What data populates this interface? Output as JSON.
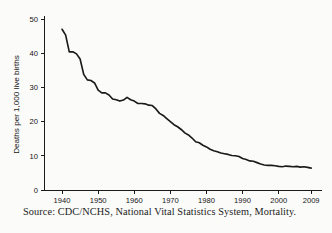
{
  "figure": {
    "source_note": "Source: CDC/NCHS, National Vital Statistics System, Mortality.",
    "background_color": "#fbfbfa",
    "line_color": "#1a1a1a",
    "axis_color": "#1b1b1b"
  },
  "chart_data": {
    "type": "line",
    "title": "",
    "subtitle": "",
    "xlabel": "",
    "ylabel": "Deaths per 1,000 live births",
    "xlim": [
      1935,
      2012
    ],
    "ylim": [
      0,
      50
    ],
    "grid": false,
    "legend": null,
    "legend_position": "none",
    "xticks": [
      1940,
      1950,
      1960,
      1970,
      1980,
      1990,
      2000,
      2009
    ],
    "xticklabels": [
      "1940",
      "1950",
      "1960",
      "1970",
      "1980",
      "1990",
      "2000",
      "2009"
    ],
    "yticks": [
      0,
      10,
      20,
      30,
      40,
      50
    ],
    "yticklabels": [
      "0",
      "10",
      "20",
      "30",
      "40",
      "50"
    ],
    "series": [
      {
        "name": "Infant mortality rate",
        "x": [
          1940,
          1941,
          1942,
          1943,
          1944,
          1945,
          1946,
          1947,
          1948,
          1949,
          1950,
          1951,
          1952,
          1953,
          1954,
          1955,
          1956,
          1957,
          1958,
          1959,
          1960,
          1961,
          1962,
          1963,
          1964,
          1965,
          1966,
          1967,
          1968,
          1969,
          1970,
          1971,
          1972,
          1973,
          1974,
          1975,
          1976,
          1977,
          1978,
          1979,
          1980,
          1981,
          1982,
          1983,
          1984,
          1985,
          1986,
          1987,
          1988,
          1989,
          1990,
          1991,
          1992,
          1993,
          1994,
          1995,
          1996,
          1997,
          1998,
          1999,
          2000,
          2001,
          2002,
          2003,
          2004,
          2005,
          2006,
          2007,
          2008,
          2009
        ],
        "values": [
          47.0,
          45.3,
          40.4,
          40.4,
          39.8,
          38.3,
          33.8,
          32.2,
          32.0,
          31.3,
          29.2,
          28.4,
          28.4,
          27.8,
          26.6,
          26.4,
          26.0,
          26.3,
          27.1,
          26.4,
          26.0,
          25.3,
          25.3,
          25.2,
          24.8,
          24.7,
          23.7,
          22.4,
          21.8,
          20.9,
          20.0,
          19.1,
          18.5,
          17.7,
          16.7,
          16.1,
          15.2,
          14.1,
          13.8,
          13.1,
          12.6,
          11.9,
          11.5,
          11.2,
          10.8,
          10.6,
          10.4,
          10.1,
          10.0,
          9.8,
          9.2,
          8.9,
          8.5,
          8.4,
          8.0,
          7.6,
          7.3,
          7.2,
          7.2,
          7.1,
          6.9,
          6.8,
          7.0,
          6.9,
          6.8,
          6.9,
          6.7,
          6.8,
          6.6,
          6.4
        ]
      }
    ]
  }
}
